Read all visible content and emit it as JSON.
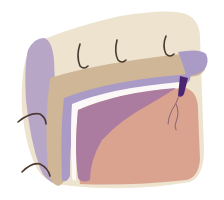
{
  "illustration": {
    "colors": {
      "background": "#ffffff",
      "outer_layer": "#ede3cf",
      "outer_edge": "#e4d7bd",
      "purple_band": "#b3a2c4",
      "tan_band": "#cdb597",
      "lavender_band": "#a99bc6",
      "white_gap": "#fbf8f7",
      "mauve_region": "#ab7c9f",
      "salmon_region": "#d9a38f",
      "suture": "#4a3a30",
      "clamp": "#4b2572",
      "vessel": "#8b6470"
    },
    "sutures_top_count": 3,
    "sutures_left_count": 2
  }
}
